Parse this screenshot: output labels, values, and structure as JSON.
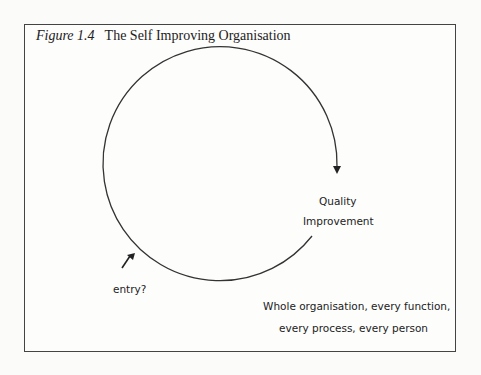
{
  "figure": {
    "number_label": "Figure 1.4",
    "title": "The Self Improving Organisation"
  },
  "diagram": {
    "cycle_label_line1": "Quality",
    "cycle_label_line2": "Improvement",
    "entry_label": "entry?",
    "scope_line1": "Whole organisation, every function,",
    "scope_line2": "every process, every person"
  },
  "colors": {
    "line": "#333333",
    "background": "#fdfdfc"
  }
}
